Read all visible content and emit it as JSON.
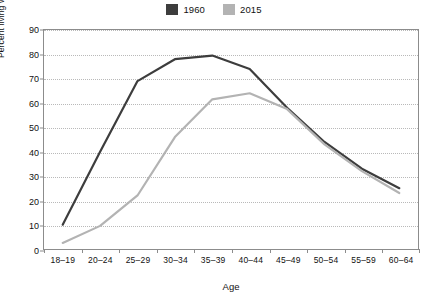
{
  "chart_data": {
    "type": "line",
    "title": "",
    "xlabel": "Age",
    "ylabel": "Percent living with at least one own child",
    "categories": [
      "18–19",
      "20–24",
      "25–29",
      "30–34",
      "35–39",
      "40–44",
      "45–49",
      "50–54",
      "55–59",
      "60–64"
    ],
    "series": [
      {
        "name": "1960",
        "color": "#3d3d3d",
        "values": [
          10,
          40,
          69,
          78,
          79.5,
          74,
          58,
          44,
          33,
          25
        ]
      },
      {
        "name": "2015",
        "color": "#b3b3b3",
        "values": [
          2.5,
          9.5,
          22,
          46,
          61.5,
          64,
          57.5,
          43,
          32,
          23
        ]
      }
    ],
    "ylim": [
      0,
      90
    ],
    "yticks": [
      0,
      10,
      20,
      30,
      40,
      50,
      60,
      70,
      80,
      90
    ],
    "ytick_labels": [
      "0",
      "10",
      "20",
      "30",
      "40",
      "50",
      "60",
      "70",
      "80",
      "90"
    ],
    "grid": true,
    "grid_axis": "y",
    "legend_position": "top-center"
  },
  "legend": {
    "entries": [
      {
        "label": "1960",
        "color": "#3d3d3d"
      },
      {
        "label": "2015",
        "color": "#b3b3b3"
      }
    ]
  },
  "axes": {
    "x_title": "Age",
    "y_title": "Percent living with at least one own child"
  }
}
